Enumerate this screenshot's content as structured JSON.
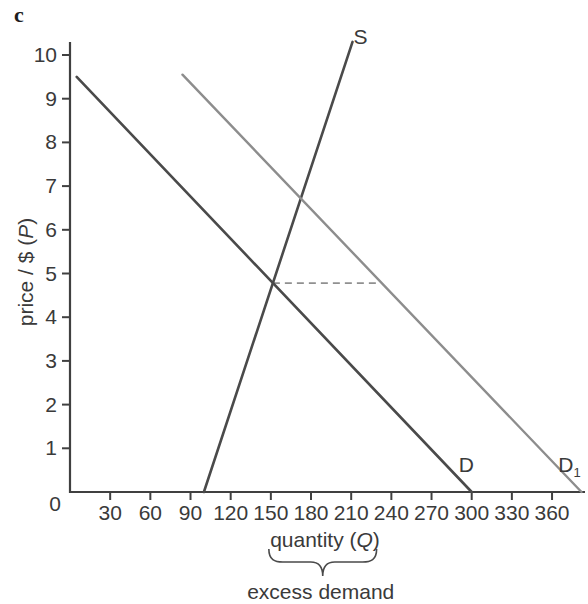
{
  "page": {
    "section_label": "c"
  },
  "chart_data": {
    "type": "line",
    "title": "",
    "xlabel": "quantity (Q)",
    "ylabel": "price / $ (P)",
    "xlim": [
      0,
      385
    ],
    "ylim": [
      0,
      10.5
    ],
    "grid": false,
    "legend": "inline-curve-labels",
    "origin_label": "0",
    "x_ticks": [
      30,
      60,
      90,
      120,
      150,
      180,
      210,
      240,
      270,
      300,
      330,
      360
    ],
    "y_ticks": [
      1,
      2,
      3,
      4,
      5,
      6,
      7,
      8,
      9,
      10
    ],
    "series": [
      {
        "name": "supply",
        "label": "S",
        "sub": "",
        "color": "#4a4a4a",
        "width": 2.6,
        "points": [
          [
            100,
            0
          ],
          [
            211,
            10.3
          ]
        ],
        "label_at": [
          217,
          10.25
        ]
      },
      {
        "name": "demand",
        "label": "D",
        "sub": "",
        "color": "#4a4a4a",
        "width": 2.6,
        "points": [
          [
            5,
            9.5
          ],
          [
            300,
            0
          ]
        ],
        "label_at": [
          296,
          0.45
        ]
      },
      {
        "name": "demand-shifted",
        "label": "D",
        "sub": "1",
        "color": "#8d8d8d",
        "width": 2.4,
        "points": [
          [
            84,
            9.55
          ],
          [
            382,
            0
          ]
        ],
        "label_at": [
          373,
          0.45
        ]
      }
    ],
    "dashed_guide": {
      "price": 4.78,
      "from_q": 151.5,
      "to_q": 231.5,
      "color": "#909090"
    },
    "annotation": {
      "brace_from_q": 148.5,
      "brace_to_q": 229,
      "label": "excess demand"
    }
  }
}
